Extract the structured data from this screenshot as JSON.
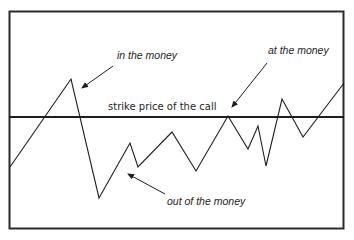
{
  "diagram": {
    "strike_line_label": "strike price of the call",
    "annotations": [
      {
        "id": "in-the-money",
        "text": "in the money"
      },
      {
        "id": "at-the-money",
        "text": "at the money"
      },
      {
        "id": "out-of-the-money",
        "text": "out of the money"
      }
    ],
    "colors": {
      "line": "#1e1e1e",
      "border": "#2a2a2a",
      "background": "#ffffff"
    }
  }
}
